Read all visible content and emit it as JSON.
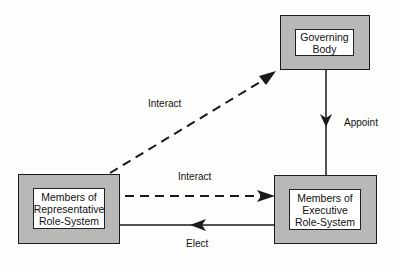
{
  "nodes": {
    "governing_body": {
      "label": "Governing\nBody"
    },
    "representative": {
      "label": "Members of\nRepresentative\nRole-System"
    },
    "executive": {
      "label": "Members of\nExecutive\nRole-System"
    }
  },
  "edges": {
    "interact_diagonal": {
      "label": "Interact",
      "style": "dashed",
      "from": "representative",
      "to": "governing_body"
    },
    "interact_horizontal": {
      "label": "Interact",
      "style": "dashed",
      "from": "representative",
      "to": "executive"
    },
    "appoint": {
      "label": "Appoint",
      "style": "solid",
      "from": "governing_body",
      "to": "executive"
    },
    "elect": {
      "label": "Elect",
      "style": "solid",
      "from": "executive",
      "to": "representative"
    }
  },
  "colors": {
    "box_fill": "#b8b8b6",
    "line": "#1a1a1a"
  }
}
